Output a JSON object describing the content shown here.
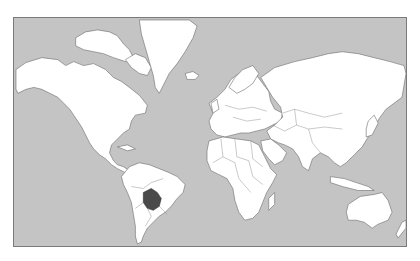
{
  "map": {
    "projection": "Mercator world map",
    "highlighted_country": "Bolivia",
    "colors": {
      "ocean": "#c4c4c4",
      "land": "#ffffff",
      "border": "#6a6a6a",
      "highlight": "#4a4a4a"
    }
  }
}
